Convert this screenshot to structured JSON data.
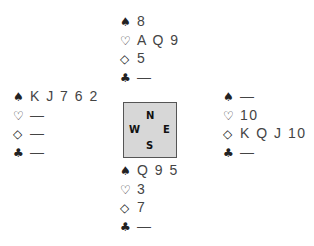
{
  "suits": {
    "spades": "♠",
    "hearts": "♡",
    "diamonds": "◇",
    "clubs": "♣"
  },
  "compass": {
    "north": "N",
    "south": "S",
    "west": "W",
    "east": "E"
  },
  "hands": {
    "north": {
      "spades": "8",
      "hearts": "A Q 9",
      "diamonds": "5",
      "clubs": "—"
    },
    "west": {
      "spades": "K J 7 6 2",
      "hearts": "—",
      "diamonds": "—",
      "clubs": "—"
    },
    "east": {
      "spades": "—",
      "hearts": "10",
      "diamonds": "K Q J 10",
      "clubs": "—"
    },
    "south": {
      "spades": "Q 9 5",
      "hearts": "3",
      "diamonds": "7",
      "clubs": "—"
    }
  }
}
